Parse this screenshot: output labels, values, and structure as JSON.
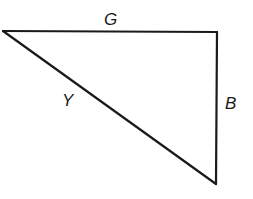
{
  "diagram": {
    "type": "right-triangle",
    "vertices": {
      "top_left": {
        "x": 3,
        "y": 31
      },
      "top_right": {
        "x": 217,
        "y": 32
      },
      "bottom_right": {
        "x": 216,
        "y": 184
      }
    },
    "edges": [
      {
        "id": "G",
        "label": "G",
        "from": "top_left",
        "to": "top_right",
        "label_pos": {
          "x": 104,
          "y": 25
        }
      },
      {
        "id": "B",
        "label": "B",
        "from": "top_right",
        "to": "bottom_right",
        "label_pos": {
          "x": 225,
          "y": 109
        }
      },
      {
        "id": "Y",
        "label": "Y",
        "from": "top_left",
        "to": "bottom_right",
        "label_pos": {
          "x": 62,
          "y": 106
        }
      }
    ],
    "stroke_color": "#1a1a1a",
    "background": "#ffffff"
  }
}
